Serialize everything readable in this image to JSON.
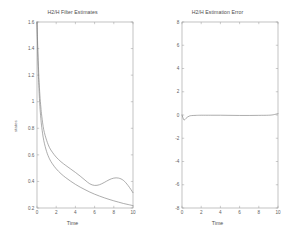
{
  "figure": {
    "width": 290,
    "height": 237,
    "background": "#ffffff",
    "line_color": "#808080",
    "axis_color": "#9a9a9a",
    "text_color": "#4d4d4d"
  },
  "left": {
    "title": "H2/H Filter Estimates",
    "xlabel": "Time",
    "ylabel": "states"
  },
  "right": {
    "title": "H2/H Estimation Error",
    "xlabel": "Time",
    "ylabel": ""
  },
  "chart_data": [
    {
      "type": "line",
      "title": "H2/H Filter Estimates",
      "xlabel": "Time",
      "ylabel": "states",
      "xlim": [
        0,
        10
      ],
      "ylim": [
        0.2,
        1.6
      ],
      "xticks": [
        0,
        2,
        4,
        6,
        8,
        10
      ],
      "xticklabels": [
        "0",
        "2",
        "4",
        "6",
        "8",
        "10"
      ],
      "yticks": [
        0.2,
        0.4,
        0.6,
        0.8,
        1,
        1.2,
        1.4,
        1.6
      ],
      "yticklabels": [
        "0.2",
        "0.4",
        "0.6",
        "0.8",
        "1",
        "1.2",
        "1.4",
        "1.6"
      ],
      "grid": false,
      "legend": "none",
      "series": [
        {
          "name": "H2 filter estimate",
          "x": [
            0,
            0.1,
            0.2,
            0.3,
            0.4,
            0.5,
            0.7,
            1.0,
            1.3,
            1.6,
            2.0,
            2.5,
            3.0,
            3.5,
            4.0,
            4.5,
            5.0,
            5.5,
            6.0,
            6.5,
            7.0,
            7.5,
            8.0,
            8.5,
            9.0,
            9.5,
            10.0
          ],
          "y": [
            1.6,
            1.36,
            1.18,
            1.05,
            0.96,
            0.89,
            0.79,
            0.71,
            0.655,
            0.62,
            0.583,
            0.548,
            0.52,
            0.494,
            0.468,
            0.44,
            0.41,
            0.382,
            0.37,
            0.375,
            0.392,
            0.412,
            0.425,
            0.425,
            0.408,
            0.368,
            0.315
          ]
        },
        {
          "name": "H-infinity filter estimate",
          "x": [
            0,
            0.1,
            0.2,
            0.3,
            0.4,
            0.5,
            0.7,
            1.0,
            1.3,
            1.6,
            2.0,
            2.5,
            3.0,
            3.5,
            4.0,
            4.5,
            5.0,
            5.5,
            6.0,
            6.5,
            7.0,
            7.5,
            8.0,
            8.5,
            9.0,
            9.5,
            10.0
          ],
          "y": [
            1.6,
            1.3,
            1.1,
            0.965,
            0.875,
            0.805,
            0.71,
            0.625,
            0.57,
            0.533,
            0.495,
            0.458,
            0.428,
            0.402,
            0.378,
            0.357,
            0.338,
            0.32,
            0.304,
            0.29,
            0.277,
            0.265,
            0.254,
            0.244,
            0.234,
            0.226,
            0.218
          ]
        }
      ]
    },
    {
      "type": "line",
      "title": "H2/H Estimation Error",
      "xlabel": "Time",
      "ylabel": "",
      "xlim": [
        0,
        10
      ],
      "ylim": [
        -8,
        8
      ],
      "xticks": [
        0,
        2,
        4,
        6,
        8,
        10
      ],
      "xticklabels": [
        "0",
        "2",
        "4",
        "6",
        "8",
        "10"
      ],
      "yticks": [
        -8,
        -6,
        -4,
        -2,
        0,
        2,
        4,
        6,
        8
      ],
      "yticklabels": [
        "-8",
        "-6",
        "-4",
        "-2",
        "0",
        "2",
        "4",
        "6",
        "8"
      ],
      "grid": false,
      "legend": "none",
      "series": [
        {
          "name": "estimation error",
          "x": [
            0,
            0.2,
            0.4,
            0.6,
            0.8,
            1.0,
            1.5,
            2.0,
            3.0,
            4.0,
            5.0,
            6.0,
            7.0,
            8.0,
            9.0,
            9.5,
            10.0
          ],
          "y": [
            0.0,
            -0.42,
            -0.3,
            -0.16,
            -0.08,
            -0.05,
            -0.03,
            -0.02,
            -0.02,
            -0.02,
            -0.03,
            -0.04,
            -0.04,
            -0.03,
            -0.02,
            0.02,
            0.12
          ]
        }
      ]
    }
  ]
}
